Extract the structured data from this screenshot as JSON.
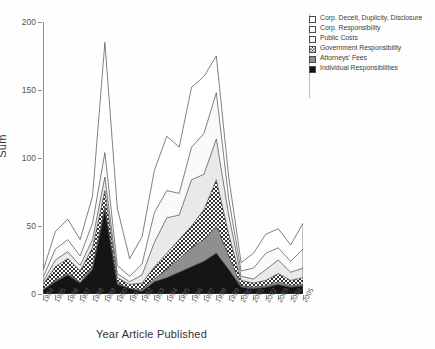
{
  "axes": {
    "ylabel": "Sum",
    "xlabel": "Year Article Published",
    "yticks": [
      "0",
      "50",
      "100",
      "150",
      "200"
    ]
  },
  "legend": {
    "items": [
      {
        "label": "Corp. Deceit, Duplicity, Disclosure",
        "swatch": "white-square-icon",
        "fill": "#ffffff"
      },
      {
        "label": "Corp. Responsibility",
        "swatch": "white-square-icon",
        "fill": "#fdfdfd"
      },
      {
        "label": "Public Costs",
        "swatch": "light-gray-square-icon",
        "fill": "#f7f7f7"
      },
      {
        "label": "Government Responsibility",
        "swatch": "checkered-square-icon",
        "fill": "#ffffff"
      },
      {
        "label": "Attorneys' Fees",
        "swatch": "gray-square-icon",
        "fill": "#8f8f8f"
      },
      {
        "label": "Individual Responsibilities",
        "swatch": "black-square-icon",
        "fill": "#151515"
      }
    ]
  },
  "chart_data": {
    "type": "area",
    "title": "",
    "xlabel": "Year Article Published",
    "ylabel": "Sum",
    "ylim": [
      0,
      200
    ],
    "xlim": [
      "1984",
      "2005"
    ],
    "grid": false,
    "legend_position": "top-right",
    "stacked": true,
    "categories": [
      "1984",
      "1985",
      "1986",
      "1987",
      "1988",
      "1989",
      "1990",
      "1991",
      "1992",
      "1993",
      "1994",
      "1995",
      "1996",
      "1997",
      "1998",
      "1999",
      "2000",
      "2001",
      "2002",
      "2003",
      "2004",
      "2005"
    ],
    "series": [
      {
        "name": "Individual Responsibilities",
        "values": [
          3,
          9,
          14,
          8,
          18,
          62,
          7,
          4,
          2,
          9,
          12,
          16,
          20,
          24,
          30,
          18,
          5,
          4,
          5,
          7,
          5,
          6
        ]
      },
      {
        "name": "Attorneys' Fees",
        "values": [
          0,
          1,
          1,
          1,
          2,
          2,
          1,
          0,
          1,
          2,
          6,
          10,
          14,
          16,
          20,
          10,
          1,
          1,
          1,
          2,
          1,
          1
        ]
      },
      {
        "name": "Government Responsibility",
        "values": [
          4,
          10,
          11,
          8,
          14,
          12,
          4,
          3,
          5,
          9,
          12,
          14,
          16,
          22,
          34,
          16,
          4,
          3,
          4,
          6,
          4,
          5
        ]
      },
      {
        "name": "Public Costs",
        "values": [
          2,
          5,
          5,
          4,
          6,
          10,
          3,
          2,
          6,
          18,
          26,
          18,
          34,
          26,
          30,
          14,
          3,
          3,
          8,
          10,
          6,
          7
        ]
      },
      {
        "name": "Corp. Responsibility",
        "values": [
          3,
          8,
          9,
          7,
          12,
          18,
          6,
          4,
          8,
          22,
          20,
          16,
          24,
          30,
          34,
          12,
          4,
          8,
          12,
          9,
          8,
          14
        ]
      },
      {
        "name": "Corp. Deceit, Duplicity, Disclosure",
        "values": [
          5,
          13,
          15,
          12,
          20,
          81,
          42,
          13,
          20,
          31,
          40,
          34,
          44,
          42,
          27,
          16,
          6,
          11,
          14,
          14,
          12,
          19
        ]
      }
    ],
    "series_totals": [
      17,
      46,
      55,
      40,
      72,
      185,
      63,
      26,
      42,
      91,
      116,
      108,
      152,
      160,
      175,
      86,
      23,
      30,
      44,
      48,
      36,
      52
    ],
    "peak_annotations": [
      {
        "year": "1989",
        "total": 185
      },
      {
        "year": "1998",
        "total": 175
      }
    ]
  }
}
